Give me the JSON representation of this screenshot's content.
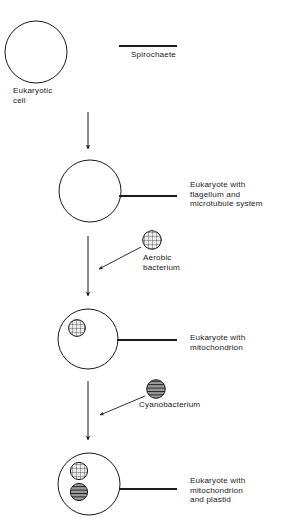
{
  "figure": {
    "stroke_color": "#1a1a1a",
    "background_color": "#ffffff",
    "organelle_fill_mitochondrion": "#e8e8e8",
    "organelle_fill_plastid": "#8a8a8a"
  },
  "labels": {
    "eukaryotic_cell": "Eukaryotic\ncell",
    "spirochaete": "Spirochaete",
    "eukaryote_flagellum": "Eukaryote with\nflagellum and\nmicrotubule system",
    "aerobic_bacterium": "Aerobic\nbacterium",
    "eukaryote_mitochondrion": "Eukaryote with\nmitochondrion",
    "cyanobacterium": "Cyanobacterium",
    "eukaryote_mitochondrion_plastid": "Eukaryote with\nmitochondrion\nand plastid"
  },
  "diagram_data": {
    "type": "diagram",
    "stages": [
      {
        "id": "stage-1",
        "label": "Eukaryotic\ncell",
        "cell": {
          "cx": 36,
          "cy": 52,
          "r": 31
        },
        "flagellum": false,
        "organelles": []
      },
      {
        "id": "stage-2",
        "label": "Eukaryote with\nflagellum and\nmicrotubule system",
        "cell": {
          "cx": 90,
          "cy": 191,
          "r": 31
        },
        "flagellum": true,
        "organelles": []
      },
      {
        "id": "stage-3",
        "label": "Eukaryote with\nmitochondrion",
        "cell": {
          "cx": 88,
          "cy": 339,
          "r": 30
        },
        "flagellum": true,
        "organelles": [
          "mitochondrion"
        ]
      },
      {
        "id": "stage-4",
        "label": "Eukaryote with\nmitochondrion\nand plastid",
        "cell": {
          "cx": 89,
          "cy": 484,
          "r": 31
        },
        "flagellum": true,
        "organelles": [
          "mitochondrion",
          "plastid"
        ]
      }
    ],
    "symbionts": [
      {
        "id": "spirochaete",
        "label": "Spirochaete",
        "shape": "line"
      },
      {
        "id": "aerobic-bacterium",
        "label": "Aerobic\nbacterium",
        "shape": "grid-circle"
      },
      {
        "id": "cyanobacterium",
        "label": "Cyanobacterium",
        "shape": "striped-circle"
      }
    ],
    "transitions": [
      {
        "from": "stage-1",
        "to": "stage-2",
        "acquires": "spirochaete"
      },
      {
        "from": "stage-2",
        "to": "stage-3",
        "acquires": "aerobic-bacterium"
      },
      {
        "from": "stage-3",
        "to": "stage-4",
        "acquires": "cyanobacterium"
      }
    ]
  }
}
